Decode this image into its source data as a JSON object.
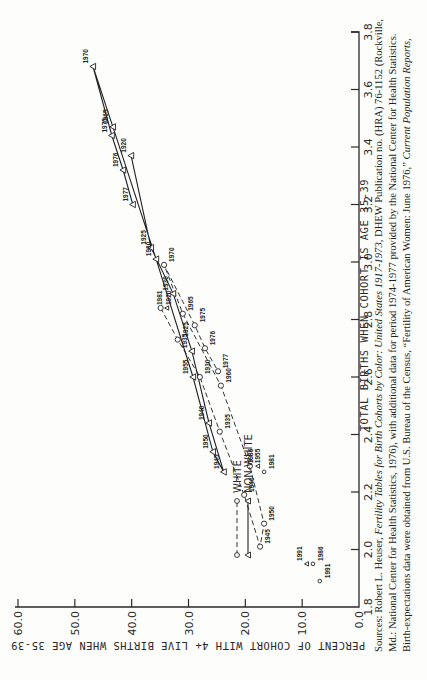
{
  "chart_data": {
    "type": "line",
    "title": "",
    "xlabel": "TOTAL BIRTHS WHEN COHORT IS AGE 35-39",
    "ylabel": "PERCENT OF COHORT WITH 4+ LIVE BIRTHS WHEN AGE 35-39",
    "xlim": [
      1.8,
      3.8
    ],
    "ylim": [
      0.0,
      60.0
    ],
    "x_ticks": [
      "1.8",
      "2.0",
      "2.2",
      "2.4",
      "2.6",
      "2.8",
      "3.0",
      "3.2",
      "3.4",
      "3.6",
      "3.8"
    ],
    "y_ticks": [
      "0.0",
      "10.0",
      "20.0",
      "30.0",
      "40.0",
      "50.0",
      "60.0"
    ],
    "grid": false,
    "orientation": "rotated 90 degrees counterclockwise on page",
    "legend": {
      "placement": "upper-left of plot",
      "entries": [
        {
          "label": "WHITE",
          "marker": "circle",
          "line": "dashed"
        },
        {
          "label": "NON-WHITE",
          "marker": "triangle",
          "line": "solid"
        }
      ]
    },
    "series": [
      {
        "name": "WHITE",
        "marker": "circle",
        "points": [
          {
            "label": "1920",
            "x": 2.84,
            "y": 34.9
          },
          {
            "label": "1925",
            "x": 2.73,
            "y": 31.9
          },
          {
            "label": "1930",
            "x": 2.6,
            "y": 28.0
          },
          {
            "label": "1935",
            "x": 2.41,
            "y": 24.5
          },
          {
            "label": "1940",
            "x": 2.19,
            "y": 20.2
          },
          {
            "label": "1945",
            "x": 2.01,
            "y": 17.4
          },
          {
            "label": "1950",
            "x": 2.09,
            "y": 16.7
          },
          {
            "label": "1955",
            "x": 2.29,
            "y": 19.2
          },
          {
            "label": "1960",
            "x": 2.57,
            "y": 24.3
          },
          {
            "label": "1965",
            "x": 2.82,
            "y": 31.0
          },
          {
            "label": "1970",
            "x": 2.99,
            "y": 34.3
          },
          {
            "label": "1975",
            "x": 2.78,
            "y": 28.9
          },
          {
            "label": "1976",
            "x": 2.7,
            "y": 27.1
          },
          {
            "label": "1977",
            "x": 2.62,
            "y": 24.8
          }
        ],
        "expectations": [
          {
            "label": "1981",
            "x": 2.27,
            "y": 16.7
          },
          {
            "label": "1986",
            "x": 1.95,
            "y": 8.1
          },
          {
            "label": "1991",
            "x": 1.89,
            "y": 6.9
          }
        ]
      },
      {
        "name": "NON-WHITE",
        "marker": "triangle",
        "points": [
          {
            "label": "1920",
            "x": 3.37,
            "y": 40.1
          },
          {
            "label": "1925",
            "x": 3.05,
            "y": 36.6
          },
          {
            "label": "1930",
            "x": 2.89,
            "y": 32.7
          },
          {
            "label": "1935",
            "x": 2.69,
            "y": 29.4
          },
          {
            "label": "1940",
            "x": 2.44,
            "y": 26.4
          },
          {
            "label": "1945",
            "x": 2.27,
            "y": 23.8
          },
          {
            "label": "1950",
            "x": 2.34,
            "y": 25.7
          },
          {
            "label": "1955",
            "x": 2.6,
            "y": 29.2
          },
          {
            "label": "1960",
            "x": 3.01,
            "y": 35.7
          },
          {
            "label": "1965",
            "x": 3.47,
            "y": 43.3
          },
          {
            "label": "1970",
            "x": 3.68,
            "y": 46.8
          },
          {
            "label": "1975",
            "x": 3.44,
            "y": 43.5
          },
          {
            "label": "1976",
            "x": 3.32,
            "y": 41.5
          },
          {
            "label": "1977",
            "x": 3.2,
            "y": 39.8
          }
        ],
        "expectations": [
          {
            "label": "1981",
            "x": 2.84,
            "y": 33.8
          },
          {
            "label": "1986",
            "x": 2.29,
            "y": 17.8
          },
          {
            "label": "1991",
            "x": 1.95,
            "y": 9.2
          }
        ]
      }
    ]
  },
  "source": {
    "prefix": "Sources: Robert L. Heuser, ",
    "title1": "Fertility Tables for Birth Cohorts by Color: United States 1917-1973",
    "middle": ", DHEW Publication no. (HRA) 76-1152 (Rockville, Md.: National Center for Health Statistics, 1976), with additional data for period 1974-1977 provided by the National Center for Health Statistics. Birth-expectations data were obtained from U.S. Bureau of the Census, “Fertility of American Women: June 1976,” ",
    "title2": "Current Population Reports,"
  }
}
